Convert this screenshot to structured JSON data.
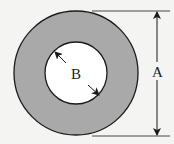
{
  "diagram": {
    "type": "annulus-dimension",
    "labels": {
      "outer_diameter": "A",
      "inner_diameter": "B"
    },
    "colors": {
      "ring_fill": "#a9a9a9",
      "inner_fill": "#ffffff",
      "stroke": "#1a1a1a",
      "background": "#f4f4f2"
    }
  }
}
